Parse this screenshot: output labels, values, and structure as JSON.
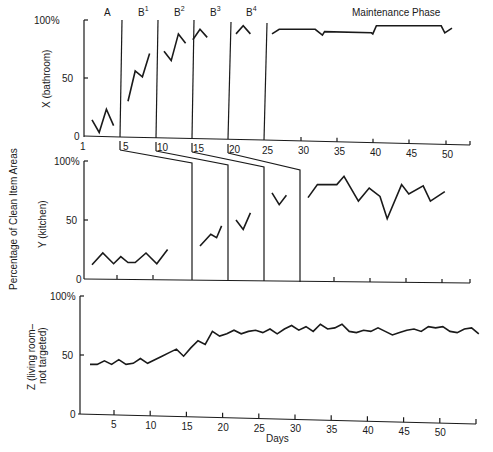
{
  "figure": {
    "ylabel_shared": "Percentage of Clean Item Areas",
    "xlabel": "Days",
    "phase_labels": [
      {
        "label": "A",
        "sup": "",
        "x": 104
      },
      {
        "label": "B",
        "sup": "1",
        "x": 138
      },
      {
        "label": "B",
        "sup": "2",
        "x": 174
      },
      {
        "label": "B",
        "sup": "3",
        "x": 210
      },
      {
        "label": "B",
        "sup": "4",
        "x": 246
      },
      {
        "label": "Maintenance Phase",
        "sup": "",
        "x": 352
      }
    ]
  },
  "chart_data": [
    {
      "type": "line",
      "title": "X (bathroom)",
      "ylabel": "X (bathroom)",
      "xlabel": "",
      "ylim": [
        0,
        100
      ],
      "yticks": [
        "0",
        "50",
        "100%"
      ],
      "xticks": [
        "1",
        "5",
        "10",
        "15",
        "20",
        "25",
        "30",
        "35",
        "40",
        "45",
        "50"
      ],
      "phases": [
        "A",
        "B1",
        "B2",
        "B3",
        "B4",
        "Maintenance Phase"
      ],
      "phase_change_days": [
        5,
        10,
        15,
        20,
        25
      ],
      "series": [
        {
          "name": "A",
          "x": [
            1,
            2,
            3,
            4
          ],
          "values": [
            14,
            3,
            23,
            9
          ]
        },
        {
          "name": "B1",
          "x": [
            6,
            7,
            8,
            9
          ],
          "values": [
            30,
            56,
            51,
            71
          ]
        },
        {
          "name": "B2",
          "x": [
            11,
            12,
            13,
            14
          ],
          "values": [
            73,
            65,
            88,
            80
          ]
        },
        {
          "name": "B3",
          "x": [
            15,
            16,
            17
          ],
          "values": [
            83,
            92,
            85
          ]
        },
        {
          "name": "B4",
          "x": [
            21,
            22,
            23
          ],
          "values": [
            88,
            95,
            88
          ]
        },
        {
          "name": "Maintenance",
          "x": [
            26,
            27,
            32,
            33,
            33.3,
            39.8,
            40,
            40.5,
            49.5,
            50,
            51
          ],
          "values": [
            88,
            92,
            92,
            87,
            90,
            89,
            88,
            95,
            95,
            89,
            93
          ]
        }
      ]
    },
    {
      "type": "line",
      "title": "Y (kitchen)",
      "ylabel": "Y (kitchen)",
      "xlabel": "",
      "ylim": [
        0,
        100
      ],
      "yticks": [
        "0",
        "50",
        "100%"
      ],
      "phase_change_days": [
        15,
        20,
        25,
        30
      ],
      "series": [
        {
          "name": "Baseline",
          "x": [
            1,
            2.5,
            4,
            5,
            6,
            7,
            8.5,
            10,
            11.5
          ],
          "values": [
            12,
            22,
            13,
            19,
            14,
            14,
            22,
            13,
            25
          ]
        },
        {
          "name": "B1",
          "x": [
            16,
            17.5,
            18.3,
            19
          ],
          "values": [
            28,
            38,
            35,
            45
          ]
        },
        {
          "name": "B2",
          "x": [
            21,
            22,
            23
          ],
          "values": [
            50,
            42,
            56
          ]
        },
        {
          "name": "B3",
          "x": [
            26,
            27,
            28
          ],
          "values": [
            73,
            63,
            71
          ]
        },
        {
          "name": "Maintenance",
          "x": [
            31,
            32.3,
            35,
            36,
            38,
            39.5,
            41,
            42,
            44,
            45,
            47,
            48,
            50
          ],
          "values": [
            69,
            80,
            80,
            87,
            66,
            77,
            70,
            51,
            80,
            72,
            79,
            66,
            74
          ]
        }
      ]
    },
    {
      "type": "line",
      "title": "Z (living room—not targeted)",
      "ylabel": "Z (living room– not targeted)",
      "xlabel": "Days",
      "ylim": [
        0,
        100
      ],
      "yticks": [
        "0",
        "50",
        "100%"
      ],
      "xticks": [
        "5",
        "10",
        "15",
        "20",
        "25",
        "30",
        "35",
        "40",
        "45",
        "50"
      ],
      "series": [
        {
          "name": "Z",
          "x": [
            1,
            2,
            3,
            4,
            5,
            6,
            7,
            8,
            9,
            10,
            11,
            12,
            13,
            14,
            15,
            16,
            17,
            18,
            19,
            20,
            21,
            22,
            23,
            24,
            25,
            26,
            27,
            28,
            29,
            30,
            31,
            32,
            33,
            34,
            35,
            36,
            37,
            38,
            39,
            40,
            41,
            42,
            43,
            44,
            45,
            46,
            47,
            48,
            49,
            50,
            51,
            52,
            53,
            54,
            55
          ],
          "values": [
            42,
            42,
            45,
            42,
            46,
            42,
            43,
            47,
            43,
            46,
            49,
            52,
            55,
            49,
            56,
            62,
            59,
            70,
            66,
            68,
            71,
            68,
            70,
            71,
            69,
            72,
            68,
            72,
            75,
            71,
            74,
            70,
            76,
            72,
            73,
            76,
            70,
            69,
            71,
            70,
            73,
            70,
            67,
            69,
            71,
            72,
            70,
            74,
            73,
            74,
            70,
            69,
            72,
            73,
            68
          ]
        }
      ]
    }
  ]
}
